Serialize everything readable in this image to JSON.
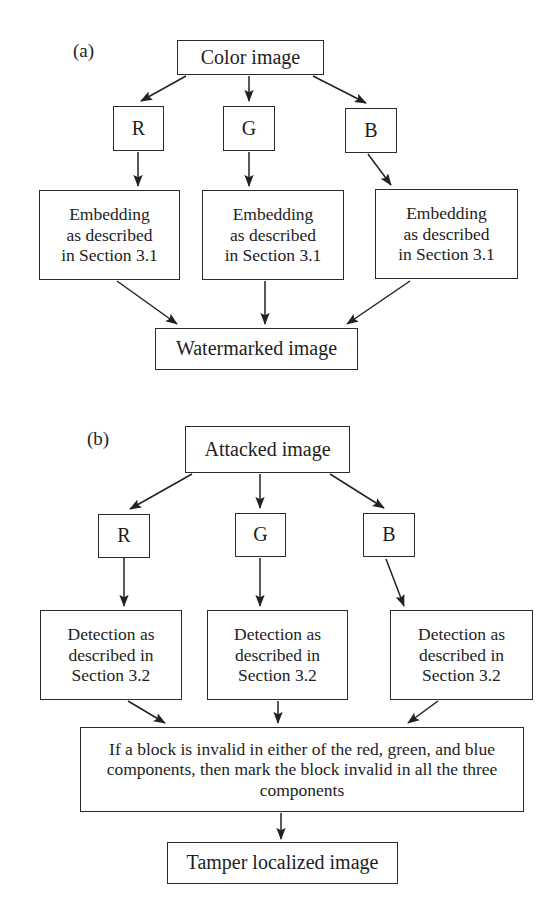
{
  "figure": {
    "kind": "flowchart",
    "panels": [
      {
        "id": "a",
        "label": "(a)",
        "source": "Color image",
        "channels": [
          {
            "name": "channel-r",
            "label": "R"
          },
          {
            "name": "channel-g",
            "label": "G"
          },
          {
            "name": "channel-b",
            "label": "B"
          }
        ],
        "processes": [
          {
            "name": "process-r",
            "label": "Embedding\nas described\nin Section 3.1"
          },
          {
            "name": "process-g",
            "label": "Embedding\nas described\nin Section 3.1"
          },
          {
            "name": "process-b",
            "label": "Embedding\nas described\nin Section 3.1"
          }
        ],
        "result": "Watermarked image"
      },
      {
        "id": "b",
        "label": "(b)",
        "source": "Attacked image",
        "channels": [
          {
            "name": "channel-r",
            "label": "R"
          },
          {
            "name": "channel-g",
            "label": "G"
          },
          {
            "name": "channel-b",
            "label": "B"
          }
        ],
        "processes": [
          {
            "name": "process-r",
            "label": "Detection as\ndescribed in\nSection 3.2"
          },
          {
            "name": "process-g",
            "label": "Detection as\ndescribed in\nSection 3.2"
          },
          {
            "name": "process-b",
            "label": "Detection as\ndescribed in\nSection 3.2"
          }
        ],
        "merge": "If a block is invalid in either of the red, green, and blue components, then mark the block invalid in all the three components",
        "result": "Tamper localized image"
      }
    ],
    "colors": {
      "stroke": "#2b2b2b",
      "text": "#1d1d1d",
      "background": "#ffffff"
    }
  }
}
